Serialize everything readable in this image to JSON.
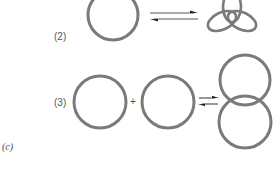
{
  "figure": {
    "panel_label": "(c)",
    "colors": {
      "ring": "#7a7a7a",
      "arrow": "#555555",
      "text": "#555555"
    },
    "reactions": [
      {
        "label": "(2)",
        "description": "unknotted circle in equilibrium with trefoil knot",
        "reactants": [
          "circle"
        ],
        "operator": "",
        "equilibrium_symbol": "⇌",
        "products": [
          "trefoil-knot"
        ]
      },
      {
        "label": "(3)",
        "description": "two separate circles in equilibrium with interlocked catenane",
        "reactants": [
          "circle",
          "circle"
        ],
        "operator": "+",
        "equilibrium_symbol": "⇌",
        "products": [
          "catenane-two-rings"
        ]
      }
    ]
  }
}
